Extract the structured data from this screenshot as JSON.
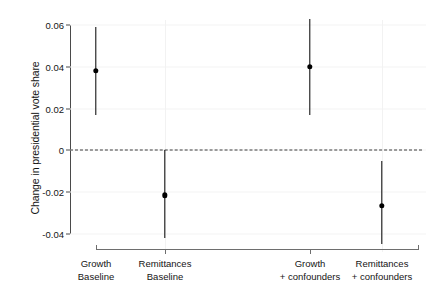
{
  "chart_data": {
    "type": "scatter",
    "title": "",
    "xlabel": "",
    "ylabel": "Change in presidential vote share",
    "ylim": [
      -0.04,
      0.06
    ],
    "yticks": [
      0.06,
      0.04,
      0.02,
      0,
      -0.02,
      -0.04
    ],
    "ytick_labels": [
      "0.06",
      "0.04",
      "0.02",
      "0",
      "-0.02",
      "-0.04"
    ],
    "grid": "faint horizontal and vertical gridlines",
    "legend": "none",
    "zero_reference_line": 0,
    "categories": [
      "Growth Baseline",
      "Remittances Baseline",
      "Growth + confounders",
      "Remittances + confounders"
    ],
    "category_labels": [
      {
        "line1": "Growth",
        "line2": "Baseline"
      },
      {
        "line1": "Remittances",
        "line2": "Baseline"
      },
      {
        "line1": "Growth",
        "line2": "+ confounders"
      },
      {
        "line1": "Remittances",
        "line2": "+ confounders"
      }
    ],
    "values": [
      0.038,
      -0.0215,
      0.04,
      -0.0265
    ],
    "ci_low": [
      0.017,
      -0.042,
      0.017,
      -0.045
    ],
    "ci_high": [
      0.059,
      0.0,
      0.063,
      -0.005
    ],
    "points": [
      {
        "category": "Growth Baseline",
        "estimate": 0.038,
        "ci_low": 0.017,
        "ci_high": 0.059
      },
      {
        "category": "Remittances Baseline",
        "estimate": -0.0215,
        "ci_low": -0.042,
        "ci_high": 0.0
      },
      {
        "category": "Growth + confounders",
        "estimate": 0.04,
        "ci_low": 0.017,
        "ci_high": 0.063
      },
      {
        "category": "Remittances + confounders",
        "estimate": -0.0265,
        "ci_low": -0.045,
        "ci_high": -0.005
      }
    ],
    "marker_color": "#000000",
    "errorbar_color": "#000000"
  }
}
